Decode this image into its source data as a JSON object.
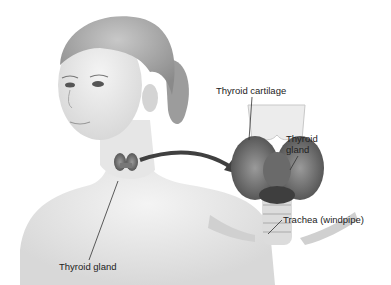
{
  "figure": {
    "labels": {
      "thyroid_cartilage": "Thyroid cartilage",
      "thyroid_gland_right_line1": "Thyroid",
      "thyroid_gland_right_line2": "gland",
      "trachea": "Trachea (windpipe)",
      "thyroid_gland_bottom": "Thyroid gland"
    },
    "colors": {
      "skin": "#e4e4e4",
      "hair": "#9a9a9a",
      "gland": "#707070",
      "arrow": "#404040",
      "text": "#222222"
    }
  }
}
